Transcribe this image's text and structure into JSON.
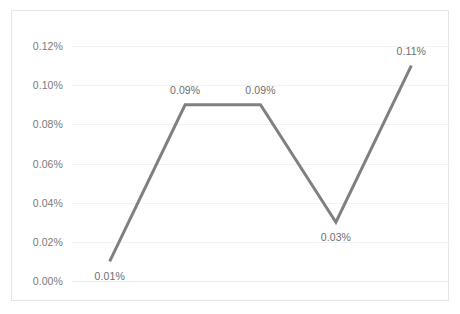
{
  "chart_data": {
    "type": "line",
    "title": "",
    "subtitle": "",
    "xlabel": "",
    "ylabel": "",
    "categories": [
      "Kazbegi",
      "Aspindza",
      "Akhalkalaki",
      "Shuakhevi",
      "Bolnisi"
    ],
    "values": [
      0.0001,
      0.0009,
      0.0009,
      0.0003,
      0.0011
    ],
    "value_labels": [
      "0.01%",
      "0.09%",
      "0.09%",
      "0.03%",
      "0.11%"
    ],
    "series": [
      {
        "name": "",
        "values": [
          0.0001,
          0.0009,
          0.0009,
          0.0003,
          0.0011
        ],
        "labels": [
          "0.01%",
          "0.09%",
          "0.09%",
          "0.03%",
          "0.11%"
        ],
        "color": "#808080"
      }
    ],
    "ylim": [
      0.0,
      0.0012
    ],
    "ytick_values": [
      0.0,
      0.0002,
      0.0004,
      0.0006,
      0.0008,
      0.001,
      0.0012
    ],
    "ytick_labels": [
      "0.00%",
      "0.02%",
      "0.04%",
      "0.06%",
      "0.08%",
      "0.10%",
      "0.12%"
    ],
    "grid": true,
    "legend": "none",
    "markers": false,
    "data_labels": true,
    "line_color": "#808080",
    "line_width": 3,
    "grid_color": "#f2f2f2",
    "axis_text_color": "#7a7a7a",
    "border_color": "#e6e6e6",
    "background": "#ffffff"
  }
}
